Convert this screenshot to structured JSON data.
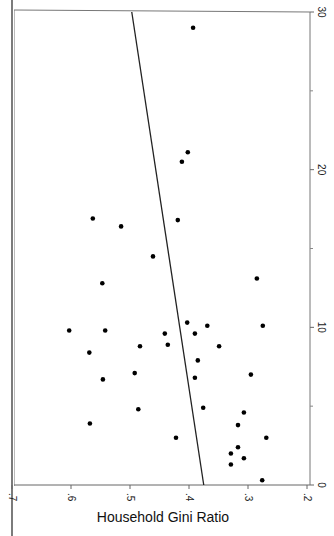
{
  "chart_data": {
    "type": "scatter",
    "orientation": "rotated-90",
    "title": "",
    "side_caption": "(numbers indicate income inequality)",
    "xlabel": "",
    "ylabel": "Household Gini Ratio",
    "x_axis": {
      "position": "right",
      "range": [
        0,
        30
      ],
      "ticks": [
        0,
        10,
        20,
        30
      ],
      "minor_ticks": [
        5,
        15,
        25
      ]
    },
    "y_axis": {
      "position": "bottom",
      "range": [
        0.2,
        0.7
      ],
      "ticks": [
        0.2,
        0.3,
        0.4,
        0.5,
        0.6,
        0.7
      ],
      "tick_labels": [
        ".2",
        ".3",
        ".4",
        ".5",
        ".6",
        ".7"
      ]
    },
    "grid": false,
    "legend": null,
    "points": [
      {
        "x": 29.0,
        "y": 0.393
      },
      {
        "x": 21.1,
        "y": 0.402
      },
      {
        "x": 20.5,
        "y": 0.412
      },
      {
        "x": 16.8,
        "y": 0.419
      },
      {
        "x": 16.9,
        "y": 0.563
      },
      {
        "x": 16.4,
        "y": 0.515
      },
      {
        "x": 14.5,
        "y": 0.461
      },
      {
        "x": 13.1,
        "y": 0.285
      },
      {
        "x": 12.8,
        "y": 0.547
      },
      {
        "x": 9.8,
        "y": 0.603
      },
      {
        "x": 9.8,
        "y": 0.542
      },
      {
        "x": 9.6,
        "y": 0.441
      },
      {
        "x": 10.3,
        "y": 0.403
      },
      {
        "x": 9.6,
        "y": 0.39
      },
      {
        "x": 10.1,
        "y": 0.369
      },
      {
        "x": 10.1,
        "y": 0.275
      },
      {
        "x": 8.9,
        "y": 0.436
      },
      {
        "x": 8.8,
        "y": 0.349
      },
      {
        "x": 8.4,
        "y": 0.569
      },
      {
        "x": 7.9,
        "y": 0.385
      },
      {
        "x": 8.8,
        "y": 0.483
      },
      {
        "x": 6.7,
        "y": 0.546
      },
      {
        "x": 7.1,
        "y": 0.492
      },
      {
        "x": 6.8,
        "y": 0.39
      },
      {
        "x": 7.0,
        "y": 0.295
      },
      {
        "x": 4.8,
        "y": 0.486
      },
      {
        "x": 4.9,
        "y": 0.376
      },
      {
        "x": 4.6,
        "y": 0.307
      },
      {
        "x": 3.9,
        "y": 0.568
      },
      {
        "x": 3.8,
        "y": 0.317
      },
      {
        "x": 3.0,
        "y": 0.269
      },
      {
        "x": 3.0,
        "y": 0.422
      },
      {
        "x": 2.4,
        "y": 0.317
      },
      {
        "x": 2.0,
        "y": 0.329
      },
      {
        "x": 1.7,
        "y": 0.307
      },
      {
        "x": 1.3,
        "y": 0.329
      },
      {
        "x": 0.3,
        "y": 0.276
      }
    ],
    "fit_line": {
      "x": [
        0,
        30
      ],
      "y": [
        0.375,
        0.497
      ]
    }
  },
  "labels": {
    "ylabel": "Household Gini Ratio",
    "side_caption": "(numbers indicate income inequality)"
  },
  "colors": {
    "points": "#000000",
    "line": "#222222",
    "axis": "#555555",
    "background": "#ffffff"
  }
}
